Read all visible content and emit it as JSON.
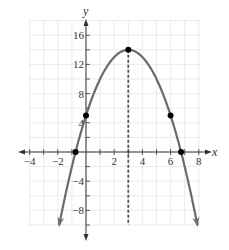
{
  "chart_data": {
    "type": "line",
    "title": "",
    "xlabel": "x",
    "ylabel": "y",
    "xlim": [
      -4,
      8
    ],
    "ylim": [
      -10,
      18
    ],
    "grid": true,
    "x_ticks": [
      -4,
      -2,
      2,
      4,
      6,
      8
    ],
    "x_tick_labels": [
      "−4",
      "−2",
      "2",
      "4",
      "6",
      "8"
    ],
    "y_ticks": [
      -8,
      -4,
      4,
      8,
      12,
      16
    ],
    "y_tick_labels": [
      "−8",
      "−4",
      "4",
      "8",
      "12",
      "16"
    ],
    "series": [
      {
        "name": "parabola",
        "equation": "y = -x^2 + 6x + 5",
        "x_range": [
          -1.9,
          7.9
        ],
        "color": "#6b6b6b"
      }
    ],
    "points": [
      {
        "label": "vertex",
        "x": 3,
        "y": 14
      },
      {
        "label": "y-intercept",
        "x": 0,
        "y": 5
      },
      {
        "label": "symmetric point",
        "x": 6,
        "y": 5
      },
      {
        "label": "x-intercept left",
        "x": -0.74,
        "y": 0
      },
      {
        "label": "x-intercept right",
        "x": 6.74,
        "y": 0
      }
    ],
    "axis_of_symmetry": {
      "x": 3,
      "style": "dashed"
    },
    "colors": {
      "curve": "#6b6b6b",
      "axes": "#333333",
      "grid": "#e6e6e6",
      "points": "#000000",
      "symmetry_line": "#555555"
    }
  }
}
